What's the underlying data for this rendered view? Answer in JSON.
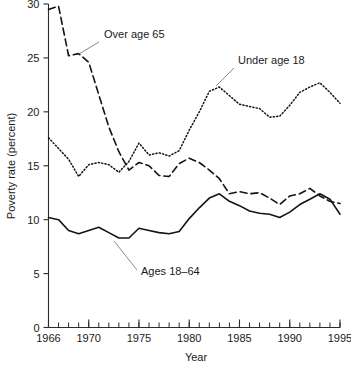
{
  "chart_data": {
    "type": "line",
    "title": "",
    "xlabel": "Year",
    "ylabel": "Poverty rate (percent)",
    "xlim": [
      1966,
      1995
    ],
    "ylim": [
      0,
      30
    ],
    "grid": false,
    "legend_position": "inline-annotations",
    "x_ticks_major": [
      1966,
      1970,
      1975,
      1980,
      1985,
      1990,
      1995
    ],
    "x_tick_labels": [
      "1966",
      "1970",
      "1975",
      "1980",
      "1985",
      "1990",
      "1995"
    ],
    "y_ticks": [
      0,
      5,
      10,
      15,
      20,
      25,
      30
    ],
    "y_tick_labels": [
      "0",
      "5",
      "10",
      "15",
      "20",
      "25",
      "30"
    ],
    "x": [
      1966,
      1967,
      1968,
      1969,
      1970,
      1971,
      1972,
      1973,
      1974,
      1975,
      1976,
      1977,
      1978,
      1979,
      1980,
      1981,
      1982,
      1983,
      1984,
      1985,
      1986,
      1987,
      1988,
      1989,
      1990,
      1991,
      1992,
      1993,
      1994,
      1995
    ],
    "series": [
      {
        "name": "Over age 65",
        "style": "dashed",
        "color": "#141414",
        "values": [
          29.5,
          29.8,
          25.2,
          25.4,
          24.6,
          21.6,
          18.6,
          16.3,
          14.6,
          15.3,
          15.0,
          14.1,
          14.0,
          15.2,
          15.7,
          15.3,
          14.6,
          13.8,
          12.4,
          12.6,
          12.4,
          12.5,
          12.0,
          11.4,
          12.2,
          12.4,
          12.9,
          12.2,
          11.7,
          11.5
        ]
      },
      {
        "name": "Under age 18",
        "style": "dotted",
        "color": "#141414",
        "values": [
          17.6,
          16.6,
          15.6,
          14.0,
          15.1,
          15.3,
          15.1,
          14.4,
          15.4,
          17.1,
          16.0,
          16.2,
          15.9,
          16.4,
          18.3,
          20.0,
          21.9,
          22.3,
          21.5,
          20.7,
          20.5,
          20.3,
          19.5,
          19.6,
          20.6,
          21.8,
          22.3,
          22.7,
          21.8,
          20.8
        ]
      },
      {
        "name": "Ages 18-64",
        "style": "solid",
        "color": "#141414",
        "values": [
          10.2,
          10.0,
          9.0,
          8.7,
          9.0,
          9.3,
          8.8,
          8.3,
          8.3,
          9.2,
          9.0,
          8.8,
          8.7,
          8.9,
          10.1,
          11.1,
          12.0,
          12.4,
          11.7,
          11.3,
          10.8,
          10.6,
          10.5,
          10.2,
          10.7,
          11.4,
          11.9,
          12.4,
          11.9,
          10.5
        ]
      }
    ],
    "annotations": [
      {
        "text": "Over age 65",
        "text_x_px": 104,
        "text_y_px": 38,
        "leader_from_px": [
          99,
          42
        ],
        "leader_to_px": [
          79,
          54
        ]
      },
      {
        "text": "Under age 18",
        "text_x_px": 238,
        "text_y_px": 64,
        "leader_from_px": [
          234,
          68
        ],
        "leader_to_px": [
          216,
          86
        ]
      },
      {
        "text": "Ages 18–64",
        "text_x_px": 141,
        "text_y_px": 275,
        "leader_from_px": [
          137,
          270
        ],
        "leader_to_px": [
          114,
          241
        ]
      }
    ]
  }
}
